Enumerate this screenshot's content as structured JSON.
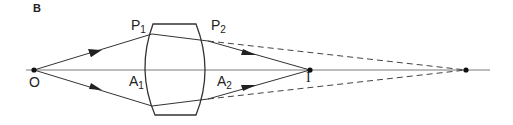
{
  "panel_label": "B",
  "labels": {
    "O": "O",
    "P1_main": "P",
    "P1_sub": "1",
    "P2_main": "P",
    "P2_sub": "2",
    "A1_main": "A",
    "A1_sub": "1",
    "A2_main": "A",
    "A2_sub": "2",
    "I": "I"
  },
  "colors": {
    "line": "#333333",
    "axis": "#777777",
    "dashed": "#444444"
  }
}
